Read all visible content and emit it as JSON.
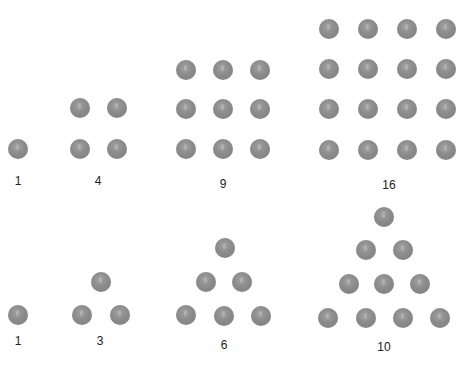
{
  "colors": {
    "dot": "#8a8a8a",
    "text": "#222222",
    "background": "#ffffff"
  },
  "figures": [
    {
      "id": "square-1",
      "label": "1",
      "label_pos": [
        18,
        174
      ],
      "dots": [
        [
          18,
          149
        ]
      ]
    },
    {
      "id": "square-4",
      "label": "4",
      "label_pos": [
        98,
        174
      ],
      "dots": [
        [
          80,
          108
        ],
        [
          117,
          108
        ],
        [
          80,
          149
        ],
        [
          117,
          149
        ]
      ]
    },
    {
      "id": "square-9",
      "label": "9",
      "label_pos": [
        223,
        177
      ],
      "dots": [
        [
          186,
          70
        ],
        [
          223,
          70
        ],
        [
          260,
          70
        ],
        [
          186,
          109
        ],
        [
          223,
          109
        ],
        [
          260,
          109
        ],
        [
          186,
          149
        ],
        [
          223,
          149
        ],
        [
          260,
          149
        ]
      ]
    },
    {
      "id": "square-16",
      "label": "16",
      "label_pos": [
        389,
        178
      ],
      "dots": [
        [
          329,
          29
        ],
        [
          368,
          29
        ],
        [
          407,
          29
        ],
        [
          446,
          29
        ],
        [
          329,
          69
        ],
        [
          368,
          69
        ],
        [
          407,
          69
        ],
        [
          446,
          69
        ],
        [
          329,
          109
        ],
        [
          368,
          109
        ],
        [
          407,
          109
        ],
        [
          446,
          109
        ],
        [
          329,
          150
        ],
        [
          368,
          150
        ],
        [
          407,
          150
        ],
        [
          446,
          150
        ]
      ]
    },
    {
      "id": "triangle-1",
      "label": "1",
      "label_pos": [
        18,
        334
      ],
      "dots": [
        [
          18,
          315
        ]
      ]
    },
    {
      "id": "triangle-3",
      "label": "3",
      "label_pos": [
        100,
        334
      ],
      "dots": [
        [
          101,
          282
        ],
        [
          82,
          315
        ],
        [
          120,
          315
        ]
      ]
    },
    {
      "id": "triangle-6",
      "label": "6",
      "label_pos": [
        224,
        338
      ],
      "dots": [
        [
          225,
          248
        ],
        [
          206,
          282
        ],
        [
          242,
          282
        ],
        [
          186,
          315
        ],
        [
          224,
          316
        ],
        [
          261,
          316
        ]
      ]
    },
    {
      "id": "triangle-10",
      "label": "10",
      "label_pos": [
        384,
        340
      ],
      "dots": [
        [
          384,
          217
        ],
        [
          366,
          250
        ],
        [
          403,
          250
        ],
        [
          349,
          284
        ],
        [
          384,
          284
        ],
        [
          420,
          284
        ],
        [
          328,
          318
        ],
        [
          366,
          318
        ],
        [
          403,
          318
        ],
        [
          440,
          318
        ]
      ]
    }
  ]
}
